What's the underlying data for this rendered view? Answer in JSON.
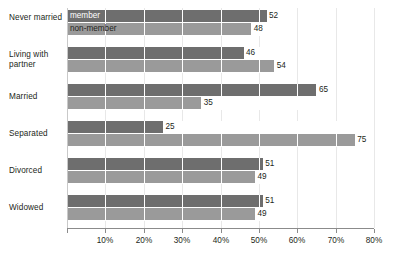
{
  "chart_data": {
    "type": "bar",
    "orientation": "horizontal",
    "title": "",
    "xlabel": "",
    "ylabel": "",
    "xlim": [
      0,
      80
    ],
    "xticks": [
      0,
      10,
      20,
      30,
      40,
      50,
      60,
      70,
      80
    ],
    "xticklabels": [
      "",
      "10%",
      "20%",
      "30%",
      "40%",
      "50%",
      "60%",
      "70%",
      "80%"
    ],
    "grid": true,
    "legend_position": "inside-first-bars",
    "categories": [
      "Never married",
      "Living with partner",
      "Married",
      "Separated",
      "Divorced",
      "Widowed"
    ],
    "series": [
      {
        "name": "member",
        "color": "#6e6e6e",
        "values": [
          52,
          46,
          65,
          25,
          51,
          51
        ],
        "labels": [
          "52",
          "46",
          "65",
          "25",
          "51",
          "51"
        ]
      },
      {
        "name": "non-member",
        "color": "#9a9a9a",
        "values": [
          48,
          54,
          35,
          75,
          49,
          49
        ],
        "labels": [
          "48",
          "54",
          "35",
          "75",
          "49",
          "49"
        ]
      }
    ]
  },
  "legend": {
    "member_label": "member",
    "nonmember_label": "non-member"
  },
  "colors": {
    "member_bar": "#6e6e6e",
    "nonmember_bar": "#9a9a9a",
    "gridline": "#ffffff",
    "axis": "#8b8b8b",
    "text": "#231f20",
    "background": "#ffffff"
  }
}
